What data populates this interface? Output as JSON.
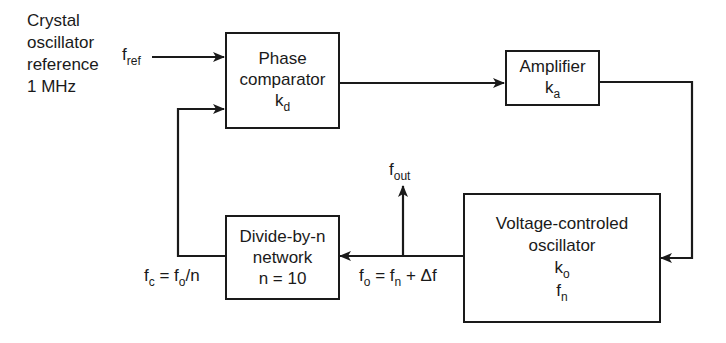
{
  "diagram": {
    "type": "block-diagram",
    "source": {
      "lines": [
        "Crystal",
        "oscillator",
        "reference",
        "1 MHz"
      ]
    },
    "signals": {
      "f_ref": {
        "base": "f",
        "sub": "ref"
      },
      "f_out": {
        "base": "f",
        "sub": "out"
      },
      "fo_eq": {
        "lhs_base": "f",
        "lhs_sub": "o",
        "eq": " = ",
        "rhs_base": "f",
        "rhs_sub": "n",
        "rhs_tail": " + Δf"
      },
      "fc_eq": {
        "lhs_base": "f",
        "lhs_sub": "c",
        "eq": " = ",
        "rhs_base": "f",
        "rhs_sub": "o",
        "rhs_tail": "/n"
      }
    },
    "blocks": {
      "phase_comparator": {
        "line1": "Phase",
        "line2": "comparator",
        "gain_base": "k",
        "gain_sub": "d"
      },
      "amplifier": {
        "line1": "Amplifier",
        "gain_base": "k",
        "gain_sub": "a"
      },
      "vco": {
        "line1": "Voltage-controled",
        "line2": "oscillator",
        "gain_base": "k",
        "gain_sub": "o",
        "freq_base": "f",
        "freq_sub": "n"
      },
      "divider": {
        "line1": "Divide-by-n",
        "line2": "network",
        "line3": "n = 10"
      }
    },
    "colors": {
      "stroke": "#1a1a1a",
      "background": "#ffffff"
    }
  }
}
